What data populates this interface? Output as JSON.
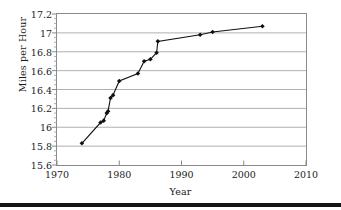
{
  "chart_data": {
    "type": "line",
    "title": "",
    "xlabel": "Year",
    "ylabel": "Miles per Hour",
    "xlim": [
      1970,
      2010
    ],
    "ylim": [
      15.6,
      17.2
    ],
    "xticks": [
      1970,
      1980,
      1990,
      2000,
      2010
    ],
    "xtick_labels": [
      "1970",
      "1980",
      "1990",
      "2000",
      "2010"
    ],
    "yticks": [
      15.6,
      15.8,
      16.0,
      16.2,
      16.4,
      16.6,
      16.8,
      17.0,
      17.2
    ],
    "ytick_labels": [
      "15.6",
      "15.8",
      "16",
      "16.2",
      "16.4",
      "16.6",
      "16.8",
      "17",
      "17.2"
    ],
    "grid": "horizontal",
    "grid_color": "#a8a8a8",
    "minor_ticks_y": true,
    "legend": "none",
    "marker": "diamond",
    "marker_color": "#111111",
    "line_color": "#111111",
    "series": [
      {
        "name": "Miles per Hour",
        "x": [
          1974,
          1977,
          1977.5,
          1978,
          1978.2,
          1978.6,
          1979,
          1980,
          1983,
          1984,
          1985,
          1986,
          1986.2,
          1993,
          1995,
          2003
        ],
        "y": [
          15.83,
          16.05,
          16.07,
          16.15,
          16.17,
          16.31,
          16.34,
          16.49,
          16.57,
          16.7,
          16.72,
          16.79,
          16.91,
          16.98,
          17.01,
          17.07
        ],
        "points": [
          {
            "x": 1974,
            "y": 15.83
          },
          {
            "x": 1977,
            "y": 16.05
          },
          {
            "x": 1977.5,
            "y": 16.07
          },
          {
            "x": 1978,
            "y": 16.15
          },
          {
            "x": 1978.2,
            "y": 16.17
          },
          {
            "x": 1978.6,
            "y": 16.31
          },
          {
            "x": 1979,
            "y": 16.34
          },
          {
            "x": 1980,
            "y": 16.49
          },
          {
            "x": 1983,
            "y": 16.57
          },
          {
            "x": 1984,
            "y": 16.7
          },
          {
            "x": 1985,
            "y": 16.72
          },
          {
            "x": 1986,
            "y": 16.79
          },
          {
            "x": 1986.2,
            "y": 16.91
          },
          {
            "x": 1993,
            "y": 16.98
          },
          {
            "x": 1995,
            "y": 17.01
          },
          {
            "x": 2003,
            "y": 17.07
          }
        ]
      }
    ]
  }
}
